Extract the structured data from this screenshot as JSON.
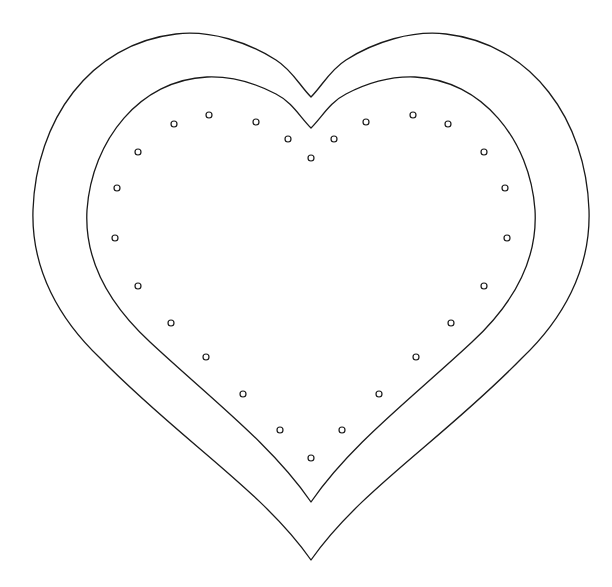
{
  "colors": {
    "background": "#ffffff",
    "line": "#1a1a1a"
  },
  "shapes": {
    "outer_heart": {
      "label": "outer heart outline"
    },
    "inner_heart": {
      "label": "inner heart outline"
    }
  },
  "stitch_holes": {
    "count": 26,
    "label": "stitch holes along inner heart"
  }
}
